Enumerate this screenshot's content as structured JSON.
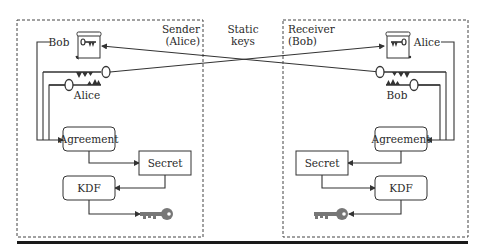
{
  "diagram": {
    "type": "static key agreement",
    "sender": {
      "title_line1": "Sender",
      "title_line2": "(Alice)",
      "certificate_owner": "Bob",
      "private_key_owner": "Alice",
      "boxes": {
        "agreement": "Agreement",
        "secret": "Secret",
        "kdf": "KDF"
      }
    },
    "receiver": {
      "title_line1": "Receiver",
      "title_line2": "(Bob)",
      "certificate_owner": "Alice",
      "private_key_owner": "Bob",
      "boxes": {
        "agreement": "Agreement",
        "secret": "Secret",
        "kdf": "KDF"
      }
    },
    "center_label_line1": "Static",
    "center_label_line2": "keys",
    "colors": {
      "line": "#333333",
      "derived_key": "#7a7a7a",
      "rule": "#1a1a1a"
    }
  }
}
